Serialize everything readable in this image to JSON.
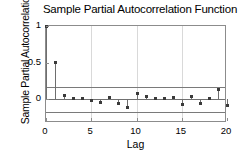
{
  "chart_data": {
    "type": "bar",
    "title": "Sample Partial Autocorrelation Function",
    "xlabel": "Lag",
    "ylabel": "Sample Partial Autocorrelation",
    "xlim": [
      0,
      20
    ],
    "ylim": [
      -0.32,
      1.0
    ],
    "grid": true,
    "legend": "none",
    "xticks": [
      "0",
      "5",
      "10",
      "15",
      "20"
    ],
    "xtick_values": [
      0,
      5,
      10,
      15,
      20
    ],
    "yticks": [
      "1",
      "0.5",
      "0"
    ],
    "ytick_values": [
      1,
      0.5,
      0
    ],
    "categories": [
      0,
      1,
      2,
      3,
      4,
      5,
      6,
      7,
      8,
      9,
      10,
      11,
      12,
      13,
      14,
      15,
      16,
      17,
      18,
      19,
      20
    ],
    "values": [
      1.0,
      0.51,
      0.06,
      0.02,
      0.01,
      -0.01,
      -0.04,
      0.03,
      -0.05,
      -0.11,
      0.08,
      0.04,
      0.01,
      0.02,
      0.03,
      -0.07,
      0.04,
      -0.06,
      0.01,
      0.13,
      -0.08
    ],
    "confidence_bounds": {
      "upper": 0.175,
      "lower": -0.175,
      "label": "approximate upper and lower confidence bounds"
    },
    "marker": "stem-with-dot",
    "series_color": "#6e6e6e",
    "bound_color": "#7a7a7a",
    "grid_color": "#d9d9d9",
    "background_color": "#ffffff"
  }
}
